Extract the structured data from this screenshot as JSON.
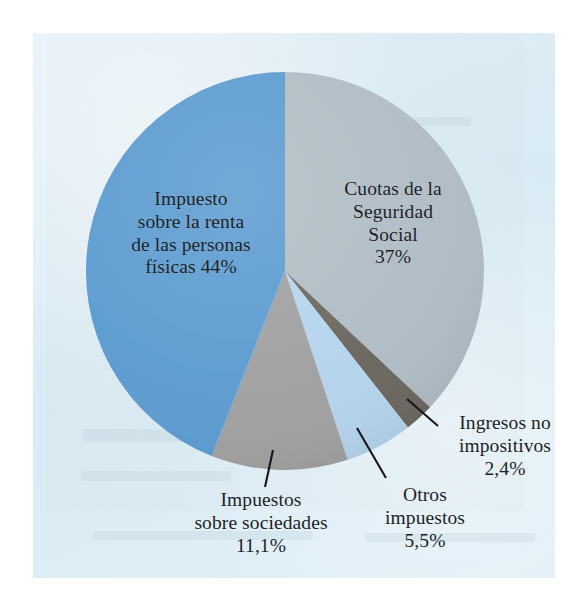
{
  "figure": {
    "type": "pie-chart-figure",
    "background_color": "#ffffff",
    "panel_color": "#dceef7"
  },
  "chart_data": {
    "type": "pie",
    "title": "",
    "subtitle": "",
    "xlabel": "",
    "ylabel": "",
    "legend_position": "none",
    "grid": false,
    "units": "percent",
    "start_angle_deg": 0,
    "direction": "clockwise",
    "categories": [
      "Cuotas de la Seguridad Social",
      "Ingresos no impositivos",
      "Otros impuestos",
      "Impuestos sobre sociedades",
      "Impuesto sobre la renta de las personas físicas"
    ],
    "values": [
      37,
      2.4,
      5.5,
      11.1,
      44
    ],
    "value_labels": [
      "37%",
      "2,4%",
      "5,5%",
      "11,1%",
      "44%"
    ],
    "colors": [
      "#b0bcc4",
      "#6b675f",
      "#b4d4ec",
      "#a0a0a0",
      "#5b9bd0"
    ],
    "slices": [
      {
        "name": "Cuotas de la Seguridad Social",
        "value": 37,
        "value_label": "37%",
        "color": "#b0bcc4",
        "start_deg": 0,
        "end_deg": 133.2,
        "label_placement": "inside"
      },
      {
        "name": "Ingresos no impositivos",
        "value": 2.4,
        "value_label": "2,4%",
        "color": "#6b675f",
        "start_deg": 133.2,
        "end_deg": 141.84,
        "label_placement": "outside-leader"
      },
      {
        "name": "Otros impuestos",
        "value": 5.5,
        "value_label": "5,5%",
        "color": "#b4d4ec",
        "start_deg": 141.84,
        "end_deg": 161.64,
        "label_placement": "outside-leader"
      },
      {
        "name": "Impuestos sobre sociedades",
        "value": 11.1,
        "value_label": "11,1%",
        "color": "#a0a0a0",
        "start_deg": 161.64,
        "end_deg": 201.6,
        "label_placement": "outside-leader"
      },
      {
        "name": "Impuesto sobre la renta de las personas físicas",
        "value": 44,
        "value_label": "44%",
        "color": "#5b9bd0",
        "start_deg": 201.6,
        "end_deg": 360,
        "label_placement": "inside"
      }
    ]
  },
  "labels": {
    "irpf": {
      "line1": "Impuesto",
      "line2": "sobre la renta",
      "line3": "de las personas",
      "line4": "físicas 44%"
    },
    "seguridad": {
      "line1": "Cuotas de la",
      "line2": "Seguridad",
      "line3": "Social",
      "line4": "37%"
    },
    "sociedades": {
      "line1": "Impuestos",
      "line2": "sobre sociedades",
      "line3": "11,1%"
    },
    "otros": {
      "line1": "Otros",
      "line2": "impuestos",
      "line3": "5,5%"
    },
    "ingresos": {
      "line1": "Ingresos no",
      "line2": "impositivos",
      "line3": "2,4%"
    }
  }
}
